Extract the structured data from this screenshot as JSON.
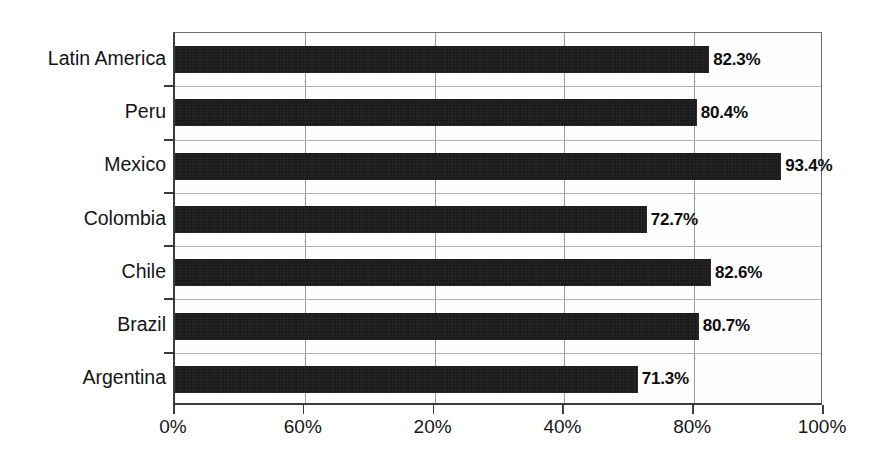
{
  "chart_data": {
    "type": "bar",
    "orientation": "horizontal",
    "title": "",
    "subtitle": "",
    "xlabel": "",
    "ylabel": "",
    "categories": [
      "Latin America",
      "Peru",
      "Mexico",
      "Colombia",
      "Chile",
      "Brazil",
      "Argentina"
    ],
    "values": [
      82.3,
      80.4,
      93.4,
      72.7,
      82.6,
      80.7,
      71.3
    ],
    "value_labels": [
      "82.3%",
      "80.4%",
      "93.4%",
      "72.7%",
      "82.6%",
      "80.7%",
      "71.3%"
    ],
    "xlim": [
      0,
      100
    ],
    "x_tick_values": [
      0,
      20,
      40,
      60,
      80,
      100
    ],
    "x_tick_labels": [
      "0%",
      "60%",
      "20%",
      "40%",
      "80%",
      "100%"
    ],
    "grid": true,
    "grid_axis": "x",
    "legend": null,
    "legend_position": "none",
    "series": [
      {
        "name": "",
        "values": [
          82.3,
          80.4,
          93.4,
          72.7,
          82.6,
          80.7,
          71.3
        ]
      }
    ],
    "annotations": [],
    "colors": {
      "bar": "#141414",
      "background": "#ffffff",
      "gridline": "#9a9a9a",
      "axis": "#3b3b3b",
      "text": "#141414"
    }
  }
}
